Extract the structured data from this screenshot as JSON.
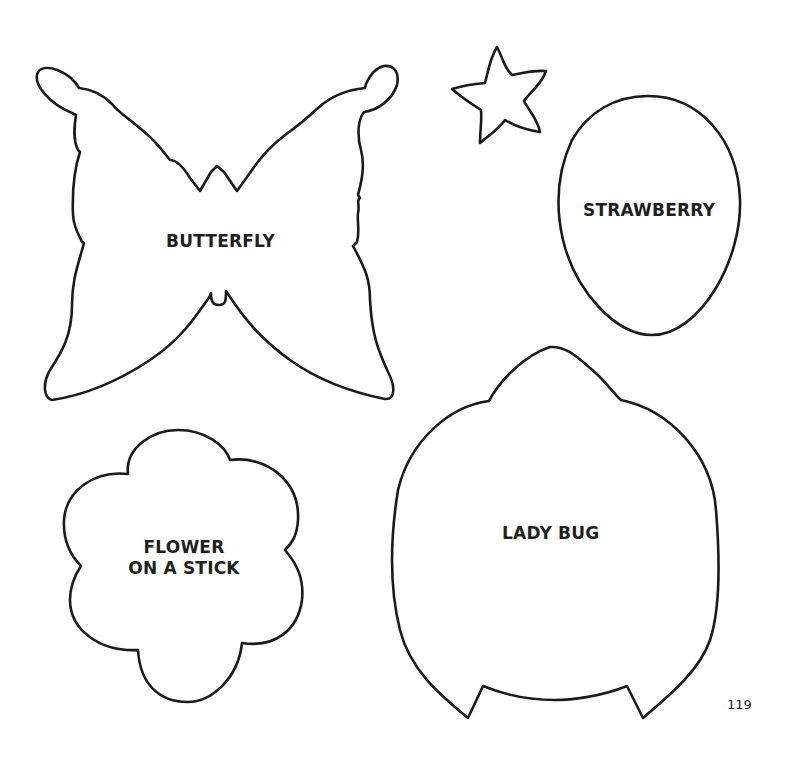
{
  "page": {
    "type": "craft template page",
    "page_number": "119",
    "background": "#ffffff",
    "line_color": "#1a1a1a"
  },
  "templates": [
    {
      "id": "butterfly",
      "label": "BUTTERFLY",
      "shape": "butterfly-outline"
    },
    {
      "id": "star",
      "label": "",
      "shape": "star-outline"
    },
    {
      "id": "strawberry",
      "label": "STRAWBERRY",
      "shape": "egg-outline"
    },
    {
      "id": "flower",
      "label_lines": [
        "FLOWER",
        "ON A STICK"
      ],
      "shape": "flower-outline"
    },
    {
      "id": "ladybug",
      "label": "LADY BUG",
      "shape": "ladybug-outline"
    }
  ]
}
